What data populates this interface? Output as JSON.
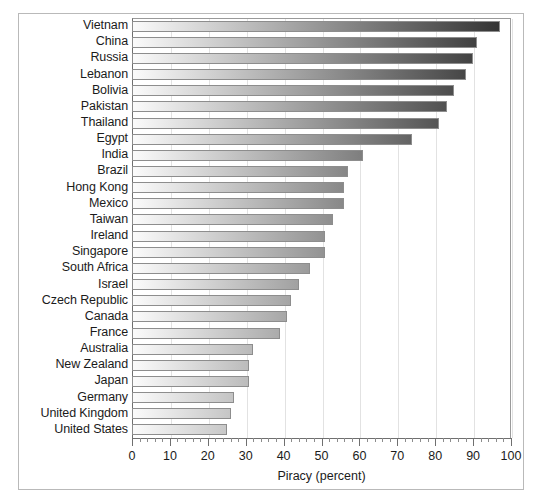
{
  "chart_data": {
    "type": "bar",
    "orientation": "horizontal",
    "title": "",
    "xlabel": "Piracy (percent)",
    "ylabel": "",
    "xlim": [
      0,
      100
    ],
    "xticks": [
      0,
      10,
      20,
      30,
      40,
      50,
      60,
      70,
      80,
      90,
      100
    ],
    "xtick_labels": [
      "0",
      "10",
      "20",
      "30",
      "40",
      "50",
      "60",
      "70",
      "80",
      "90",
      "100"
    ],
    "minor_tick_step": 2,
    "grid": "vertical-major",
    "legend": "none",
    "bar_fill": "horizontal-gradient-light-to-dark",
    "colors": {
      "bar_gradient_start": "#fbfbfb",
      "bar_gradient_end": "#2e2e2e",
      "bar_border": "#8d8d8d",
      "gridline": "#e2e2e2",
      "axis": "#6f6f6f",
      "frame": "#b9b9b9",
      "text": "#1b1b1b",
      "background": "#ffffff"
    },
    "categories": [
      "Vietnam",
      "China",
      "Russia",
      "Lebanon",
      "Bolivia",
      "Pakistan",
      "Thailand",
      "Egypt",
      "India",
      "Brazil",
      "Hong Kong",
      "Mexico",
      "Taiwan",
      "Ireland",
      "Singapore",
      "South Africa",
      "Israel",
      "Czech Republic",
      "Canada",
      "France",
      "Australia",
      "New Zealand",
      "Japan",
      "Germany",
      "United Kingdom",
      "United States"
    ],
    "values": [
      97,
      91,
      90,
      88,
      85,
      83,
      81,
      74,
      61,
      57,
      56,
      56,
      53,
      51,
      51,
      47,
      44,
      42,
      41,
      39,
      32,
      31,
      31,
      27,
      26,
      25
    ]
  }
}
